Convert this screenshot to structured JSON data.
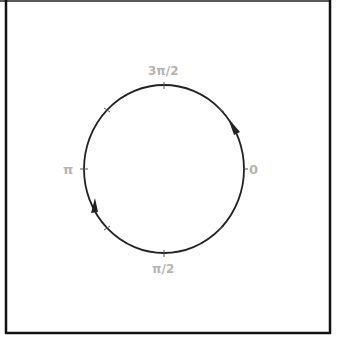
{
  "diagram": {
    "type": "unit-circle-contour",
    "colors": {
      "curve": "#222222",
      "labels": "#b4b4b4",
      "border": "#111111",
      "background": "#ffffff"
    },
    "direction": "clockwise",
    "labels": {
      "right": "0",
      "bottom": "π/2",
      "left": "π",
      "top": "3π/2"
    },
    "tick_marks": 8,
    "arrows": 2
  }
}
